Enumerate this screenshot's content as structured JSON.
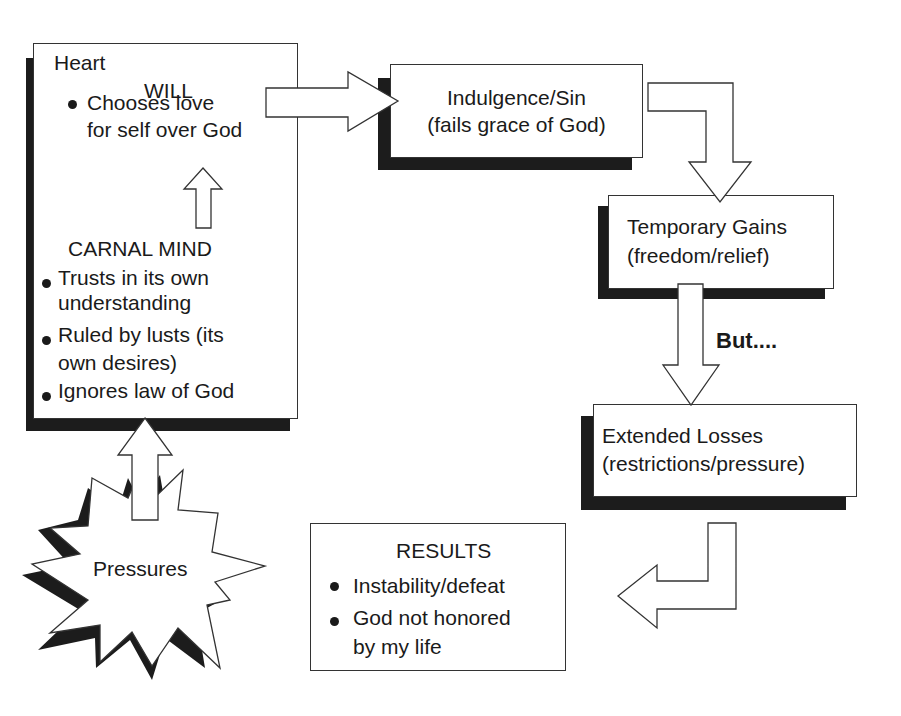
{
  "heart_box": {
    "title": "Heart",
    "will": {
      "heading": "WILL",
      "bullets": [
        {
          "line1": "Chooses love",
          "line2": "for self over God"
        }
      ]
    },
    "carnal_mind": {
      "heading": "CARNAL MIND",
      "bullets": [
        {
          "line1": "Trusts in its own",
          "line2": "understanding"
        },
        {
          "line1": "Ruled by lusts (its",
          "line2": "own desires)"
        },
        {
          "line1": "Ignores law of God",
          "line2": ""
        }
      ]
    }
  },
  "indulgence_box": {
    "line1": "Indulgence/Sin",
    "line2": "(fails grace of God)"
  },
  "gains_box": {
    "line1": "Temporary Gains",
    "line2": "(freedom/relief)"
  },
  "but_label": "But....",
  "losses_box": {
    "line1": "Extended Losses",
    "line2": "(restrictions/pressure)"
  },
  "results_box": {
    "heading": "RESULTS",
    "bullets": [
      {
        "line1": "Instability/defeat",
        "line2": ""
      },
      {
        "line1": "God not honored",
        "line2": "by my life"
      }
    ]
  },
  "pressures_burst": {
    "label": "Pressures"
  },
  "colors": {
    "stroke": "#333333",
    "shadow": "#1c1c1c",
    "fill": "#ffffff",
    "text": "#1a1a1a"
  },
  "flow": [
    "Pressures -> Carnal Mind",
    "Carnal Mind -> Will",
    "Heart -> Indulgence/Sin",
    "Indulgence/Sin -> Temporary Gains",
    "Temporary Gains -> Extended Losses",
    "Extended Losses -> Results"
  ]
}
